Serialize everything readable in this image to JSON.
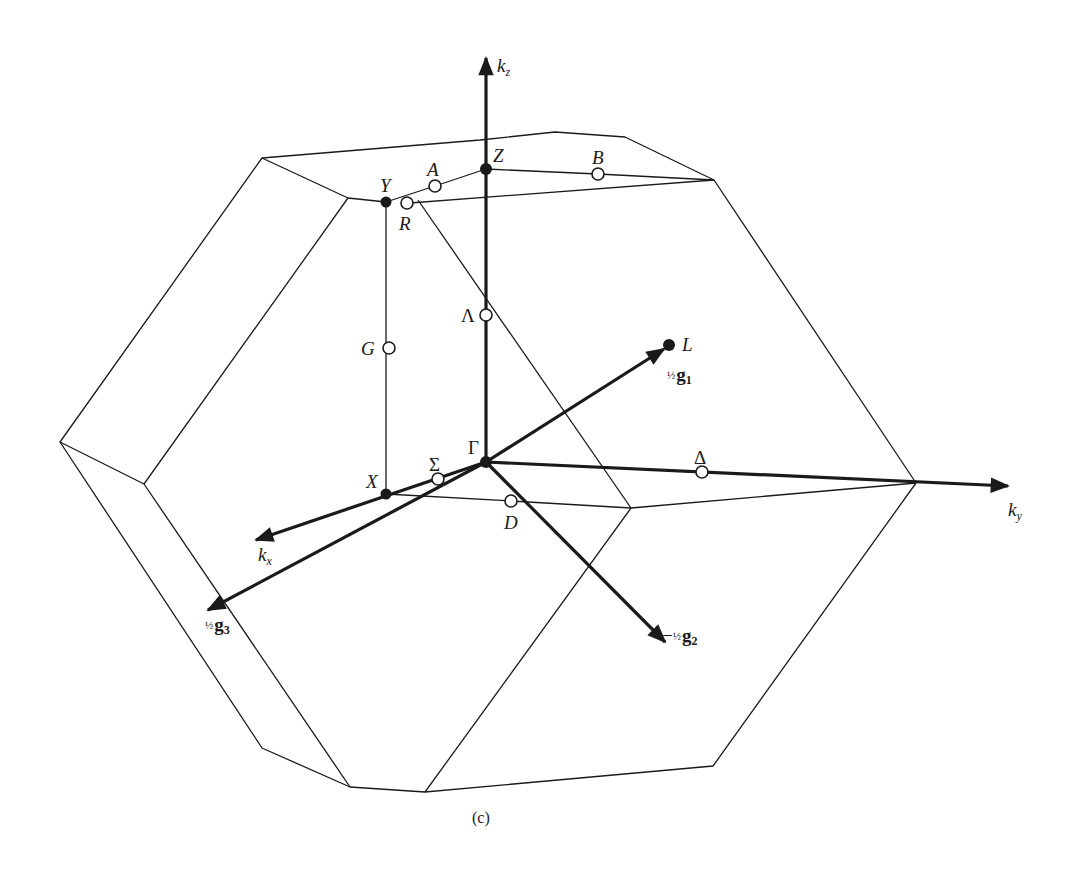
{
  "figure": {
    "type": "brillouin-zone-diagram",
    "caption": "(c)",
    "colors": {
      "background": "#ffffff",
      "ink": "#1a1a1a"
    }
  },
  "axes": [
    {
      "id": "kz",
      "label": "k",
      "subscript": "z"
    },
    {
      "id": "ky",
      "label": "k",
      "subscript": "y"
    },
    {
      "id": "kx",
      "label": "k",
      "subscript": "x"
    }
  ],
  "vectors": [
    {
      "id": "g1",
      "prefix": "",
      "fraction": "½",
      "symbol": "g",
      "subscript": "1"
    },
    {
      "id": "g2",
      "prefix": "−",
      "fraction": "½",
      "symbol": "g",
      "subscript": "2"
    },
    {
      "id": "g3",
      "prefix": "",
      "fraction": "½",
      "symbol": "g",
      "subscript": "3"
    }
  ],
  "points": {
    "filled": [
      {
        "id": "Gamma",
        "label": "Γ"
      },
      {
        "id": "Z",
        "label": "Z"
      },
      {
        "id": "Y",
        "label": "Y"
      },
      {
        "id": "X",
        "label": "X"
      },
      {
        "id": "L",
        "label": "L"
      }
    ],
    "open": [
      {
        "id": "A",
        "label": "A"
      },
      {
        "id": "B",
        "label": "B"
      },
      {
        "id": "R",
        "label": "R"
      },
      {
        "id": "Lambda",
        "label": "Λ"
      },
      {
        "id": "G",
        "label": "G"
      },
      {
        "id": "Sigma",
        "label": "Σ"
      },
      {
        "id": "Delta",
        "label": "Δ"
      },
      {
        "id": "D",
        "label": "D"
      }
    ]
  }
}
